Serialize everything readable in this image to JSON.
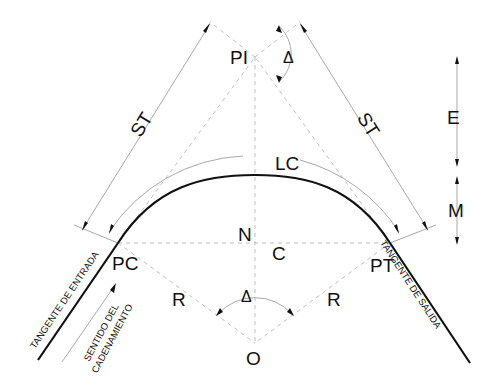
{
  "diagram": {
    "points": {
      "PI": "PI",
      "PC": "PC",
      "PT": "PT",
      "O": "O",
      "N": "N"
    },
    "labels": {
      "ST_left": "ST",
      "ST_right": "ST",
      "LC": "LC",
      "C": "C",
      "E": "E",
      "M": "M",
      "R_left": "R",
      "R_right": "R",
      "delta_top": "Δ",
      "delta_center": "Δ"
    },
    "annotations": {
      "tangente_entrada": "TANGENTE  DE  ENTRADA",
      "tangente_salida": "TANGENTE  DE  SALIDA",
      "sentido_line1": "SENTIDO  DEL",
      "sentido_line2": "CADENAMIENTO"
    },
    "colors": {
      "curve": "#111111",
      "construction": "#bdbdbd",
      "dimension": "#a8a8a8"
    }
  }
}
